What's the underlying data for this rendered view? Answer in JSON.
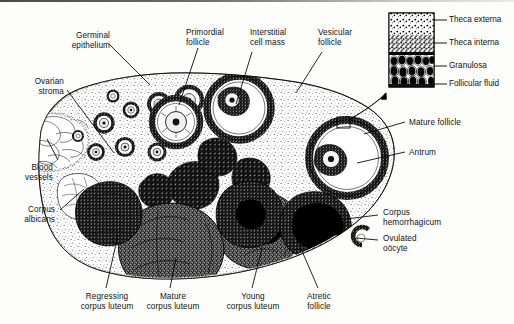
{
  "figure": {
    "kind": "histology-diagram",
    "ink": "#1a1a1a",
    "paper": "#fdfdfc"
  },
  "labels": {
    "germinal_epithelium": "Germinal\nepithelium",
    "ovarian_stroma": "Ovarian\nstroma",
    "blood_vessels": "Blood\nvessels",
    "corpus_albicans": "Corpus\nalbicans",
    "primordial_follicle": "Primordial\nfollicle",
    "interstitial_cell_mass": "Interstitial\ncell mass",
    "vesicular_follicle": "Vesicular\nfollicle",
    "mature_follicle": "Mature follicle",
    "antrum": "Antrum",
    "corpus_hemorrhagicum": "Corpus\nhemorrhagicum",
    "ovulated_oocyte": "Ovulated\noöcyte",
    "regressing_corpus_luteum": "Regressing\ncorpus luteum",
    "mature_corpus_luteum": "Mature\ncorpus luteum",
    "young_corpus_luteum": "Young\ncorpus luteum",
    "atretic_follicle": "Atretic\nfollicle"
  },
  "inset": {
    "title_absent": true,
    "layers": [
      {
        "name": "theca-externa",
        "label": "Theca externa"
      },
      {
        "name": "theca-interna",
        "label": "Theca interna"
      },
      {
        "name": "granulosa",
        "label": "Granulosa"
      },
      {
        "name": "follicular-fluid",
        "label": "Follicular fluid"
      }
    ]
  }
}
